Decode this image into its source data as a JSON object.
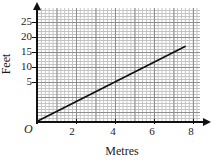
{
  "chart_data": {
    "type": "line",
    "title": "",
    "subtitle": "",
    "xlabel": "Metres",
    "ylabel": "Feet",
    "origin_label": "O",
    "xlim": [
      0,
      8.6
    ],
    "ylim": [
      0,
      28
    ],
    "x_ticks": [
      2,
      4,
      6,
      8
    ],
    "x_tick_labels": [
      "2",
      "4",
      "6",
      "8"
    ],
    "y_ticks": [
      5,
      10,
      15,
      20,
      25
    ],
    "y_tick_labels": [
      "5",
      "10",
      "15",
      "20",
      "25"
    ],
    "grid": true,
    "grid_minor_spacing_x": 0.2,
    "grid_minor_spacing_y": 1,
    "grid_major_spacing_x": 1,
    "grid_major_spacing_y": 5,
    "legend": "none",
    "series": [
      {
        "name": "Metres to Feet conversion",
        "x": [
          0,
          7.6
        ],
        "y": [
          0,
          25
        ],
        "points": [
          [
            0,
            0
          ],
          [
            1,
            3.3
          ],
          [
            2,
            6.6
          ],
          [
            3,
            9.9
          ],
          [
            4,
            13.1
          ],
          [
            5,
            16.4
          ],
          [
            6,
            19.7
          ],
          [
            7,
            23.0
          ],
          [
            7.6,
            25
          ]
        ],
        "color": "#111111",
        "style": "solid"
      }
    ],
    "annotations": [],
    "colors": {
      "axis": "#111111",
      "grid_major": "#8d8d8d",
      "grid_minor": "#c4c4c4",
      "line": "#111111",
      "background": "#ffffff"
    }
  }
}
